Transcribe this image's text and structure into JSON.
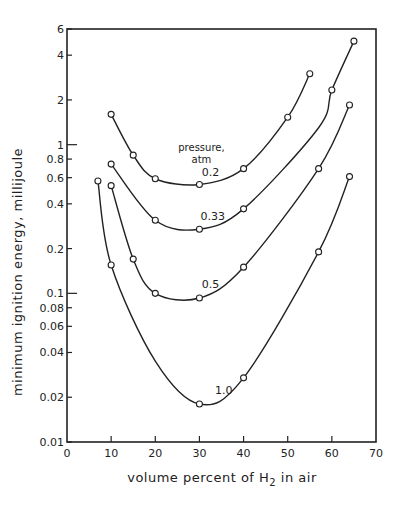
{
  "chart_data": {
    "type": "line",
    "title": "",
    "xlabel": "volume percent of H2 in air",
    "xlabel_parts": {
      "pre": "volume  percent  of  H",
      "sub": "2",
      "post": " in  air"
    },
    "ylabel": "minimum  ignition  energy,  millijoule",
    "xlim": [
      0,
      70
    ],
    "ylim": [
      0.01,
      6
    ],
    "yscale": "log",
    "grid": false,
    "x_ticks": [
      0,
      10,
      20,
      30,
      40,
      50,
      60,
      70
    ],
    "x_tick_labels": [
      "0",
      "10",
      "20",
      "30",
      "40",
      "50",
      "60",
      "70"
    ],
    "y_ticks": [
      0.01,
      0.02,
      0.04,
      0.06,
      0.08,
      0.1,
      0.2,
      0.4,
      0.6,
      0.8,
      1,
      2,
      4,
      6
    ],
    "y_tick_labels": [
      "0.01",
      "0.02",
      "0.04",
      "0.06",
      "0.08",
      "0.1",
      "0.2",
      "0.4",
      "0.6",
      "0.8",
      "1",
      "2",
      "4",
      "6"
    ],
    "y_major_ticks": [
      0.1,
      1
    ],
    "annotation": {
      "line1": "pressure,",
      "line2": "atm",
      "x": 30,
      "y": 0.75
    },
    "series": [
      {
        "name": "0.2",
        "label": "0.2",
        "label_pos": {
          "x": 32.5,
          "y": 0.62
        },
        "x": [
          10,
          15,
          20,
          30,
          40,
          50,
          55
        ],
        "y": [
          1.6,
          0.85,
          0.59,
          0.54,
          0.69,
          1.53,
          3.0
        ],
        "markers": [
          10,
          15,
          20,
          30,
          40,
          50,
          55
        ]
      },
      {
        "name": "0.33",
        "label": "0.33",
        "label_pos": {
          "x": 33,
          "y": 0.31
        },
        "x": [
          10,
          20,
          30,
          40,
          57,
          60,
          65
        ],
        "y": [
          0.74,
          0.31,
          0.27,
          0.37,
          1.3,
          2.33,
          4.97
        ],
        "markers": [
          10,
          20,
          30,
          40,
          60,
          65
        ]
      },
      {
        "name": "0.5",
        "label": "0.5",
        "label_pos": {
          "x": 32.5,
          "y": 0.108
        },
        "x": [
          10,
          15,
          20,
          30,
          40,
          57,
          64
        ],
        "y": [
          0.53,
          0.17,
          0.1,
          0.093,
          0.15,
          0.69,
          1.85
        ],
        "markers": [
          10,
          15,
          20,
          30,
          40,
          57,
          64
        ]
      },
      {
        "name": "1.0",
        "label": "1.0",
        "label_pos": {
          "x": 35.5,
          "y": 0.021
        },
        "x": [
          7,
          10,
          20,
          30,
          40,
          57,
          64
        ],
        "y": [
          0.57,
          0.155,
          0.035,
          0.018,
          0.027,
          0.19,
          0.61
        ],
        "markers": [
          7,
          10,
          30,
          40,
          57,
          64
        ]
      }
    ]
  }
}
